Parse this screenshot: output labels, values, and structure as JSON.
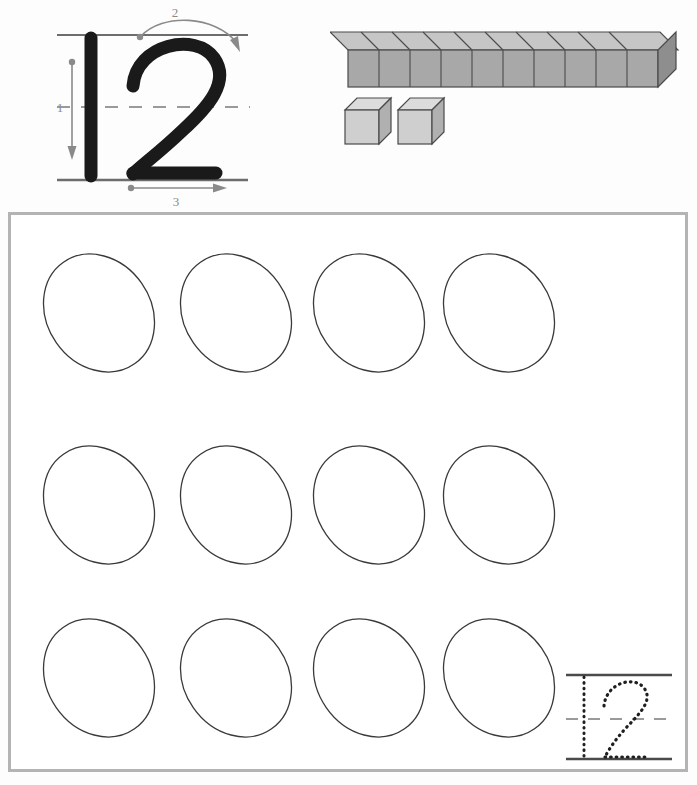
{
  "worksheet": {
    "number_word": "twelve",
    "number_value": "12",
    "digits": [
      "1",
      "2"
    ]
  },
  "stroke_guide": {
    "title": "12",
    "strokes": [
      {
        "id": "1",
        "label": "1",
        "digit": "1",
        "direction": "down",
        "type": "vertical-arrow"
      },
      {
        "id": "2",
        "label": "2",
        "digit": "2",
        "direction": "curve-right",
        "type": "curved-arrow"
      },
      {
        "id": "3",
        "label": "3",
        "digit": "2",
        "direction": "right",
        "type": "horizontal-arrow"
      }
    ],
    "rule_lines": {
      "top": "solid",
      "middle": "dashed",
      "bottom": "solid"
    },
    "colors": {
      "digit": "#1a1a1a",
      "rule_line": "#6d6d6d",
      "mid_line": "#9a9a9a",
      "arrow": "#8a8a8a",
      "label": "#8a8a8a"
    }
  },
  "block_model": {
    "rod_label": "ten-rod",
    "rod_units": 10,
    "unit_cubes": 2,
    "total": 12,
    "colors": {
      "front": "#a8a8a8",
      "top": "#c6c6c6",
      "side": "#8e8e8e",
      "cube_front": "#cfcfcf",
      "cube_top": "#dcdcdc",
      "cube_side": "#b0b0b0",
      "outline": "#4a4a4a"
    }
  },
  "practice_panel": {
    "border_color": "#b4b4b4",
    "shape_name": "egg",
    "shape_outline_color": "#3a3a3a",
    "rows": 3,
    "columns": 4,
    "count": 12,
    "shapes": [
      {
        "row": 1,
        "col": 1,
        "cx": 88,
        "cy": 98,
        "rx": 52,
        "ry": 62,
        "rotate": -35
      },
      {
        "row": 1,
        "col": 2,
        "cx": 225,
        "cy": 98,
        "rx": 52,
        "ry": 62,
        "rotate": -35
      },
      {
        "row": 1,
        "col": 3,
        "cx": 358,
        "cy": 98,
        "rx": 52,
        "ry": 62,
        "rotate": -35
      },
      {
        "row": 1,
        "col": 4,
        "cx": 488,
        "cy": 98,
        "rx": 52,
        "ry": 62,
        "rotate": -35
      },
      {
        "row": 2,
        "col": 1,
        "cx": 88,
        "cy": 290,
        "rx": 52,
        "ry": 62,
        "rotate": -35
      },
      {
        "row": 2,
        "col": 2,
        "cx": 225,
        "cy": 290,
        "rx": 52,
        "ry": 62,
        "rotate": -35
      },
      {
        "row": 2,
        "col": 3,
        "cx": 358,
        "cy": 290,
        "rx": 52,
        "ry": 62,
        "rotate": -35
      },
      {
        "row": 2,
        "col": 4,
        "cx": 488,
        "cy": 290,
        "rx": 52,
        "ry": 62,
        "rotate": -35
      },
      {
        "row": 3,
        "col": 1,
        "cx": 88,
        "cy": 463,
        "rx": 52,
        "ry": 62,
        "rotate": -35
      },
      {
        "row": 3,
        "col": 2,
        "cx": 225,
        "cy": 463,
        "rx": 52,
        "ry": 62,
        "rotate": -35
      },
      {
        "row": 3,
        "col": 3,
        "cx": 358,
        "cy": 463,
        "rx": 52,
        "ry": 62,
        "rotate": -35
      },
      {
        "row": 3,
        "col": 4,
        "cx": 488,
        "cy": 463,
        "rx": 52,
        "ry": 62,
        "rotate": -35
      }
    ]
  },
  "trace_box": {
    "value": "12",
    "style": "dotted",
    "rule_lines": {
      "top": "solid",
      "middle": "dashed",
      "bottom": "solid"
    },
    "colors": {
      "dots": "#1f1f1f",
      "rule_line": "#4a4a4a",
      "mid_line": "#9a9a9a"
    }
  }
}
